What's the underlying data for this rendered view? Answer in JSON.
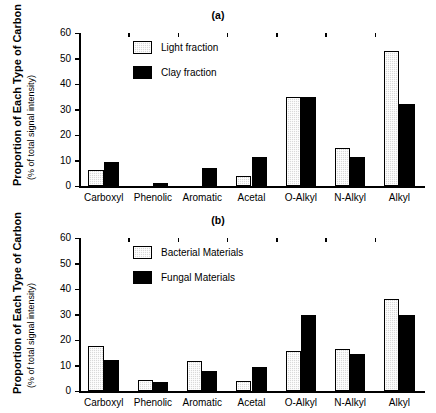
{
  "figure": {
    "width": 436,
    "height": 413,
    "background": "#ffffff",
    "bar_light_color": "#d9d9d9",
    "bar_dark_color": "#000000",
    "axis_color": "#000000"
  },
  "axis": {
    "y_title_main": "Proportion of Each Type of Carbon",
    "y_title_sub": "(% of total signal intensity)",
    "y_ticks": [
      "0",
      "10",
      "20",
      "30",
      "40",
      "50",
      "60"
    ],
    "x_categories": [
      "Carboxyl",
      "Phenolic",
      "Aromatic",
      "Acetal",
      "O-Alkyl",
      "N-Alkyl",
      "Alkyl"
    ]
  },
  "panels": [
    {
      "id": "a",
      "label": "(a)",
      "legend": [
        {
          "name": "Light fraction",
          "style": "light"
        },
        {
          "name": "Clay fraction",
          "style": "dark"
        }
      ]
    },
    {
      "id": "b",
      "label": "(b)",
      "legend": [
        {
          "name": "Bacterial Materials",
          "style": "light"
        },
        {
          "name": "Fungal Materials",
          "style": "dark"
        }
      ]
    }
  ],
  "chart_data": [
    {
      "type": "bar",
      "title": "(a)",
      "xlabel": "",
      "ylabel": "Proportion of Each Type of Carbon (% of total signal intensity)",
      "ylim": [
        0,
        60
      ],
      "ytick_step": 10,
      "grid": false,
      "legend_position": "upper-left-inside",
      "categories": [
        "Carboxyl",
        "Phenolic",
        "Aromatic",
        "Acetal",
        "O-Alkyl",
        "N-Alkyl",
        "Alkyl"
      ],
      "series": [
        {
          "name": "Light fraction",
          "style": "light",
          "values": [
            6.2,
            0.0,
            0.0,
            3.8,
            34.8,
            14.8,
            53.0
          ]
        },
        {
          "name": "Clay fraction",
          "style": "dark",
          "values": [
            9.5,
            1.0,
            7.0,
            11.5,
            35.0,
            11.5,
            32.3
          ]
        }
      ]
    },
    {
      "type": "bar",
      "title": "(b)",
      "xlabel": "",
      "ylabel": "Proportion of Each Type of Carbon (% of total signal intensity)",
      "ylim": [
        0,
        60
      ],
      "ytick_step": 10,
      "grid": false,
      "legend_position": "upper-left-inside",
      "categories": [
        "Carboxyl",
        "Phenolic",
        "Aromatic",
        "Acetal",
        "O-Alkyl",
        "N-Alkyl",
        "Alkyl"
      ],
      "series": [
        {
          "name": "Bacterial Materials",
          "style": "light",
          "values": [
            17.5,
            4.2,
            11.7,
            4.0,
            15.5,
            16.3,
            36.0
          ]
        },
        {
          "name": "Fungal Materials",
          "style": "dark",
          "values": [
            12.2,
            3.5,
            7.8,
            9.5,
            30.0,
            14.7,
            29.8
          ]
        }
      ]
    }
  ]
}
